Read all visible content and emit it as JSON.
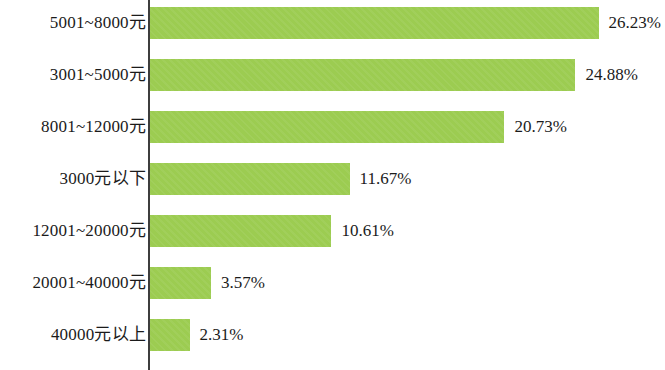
{
  "chart_data": {
    "type": "bar",
    "orientation": "horizontal",
    "title": "",
    "subtitle": "",
    "xlabel": "",
    "ylabel": "",
    "grid": false,
    "legend": null,
    "axis_line": true,
    "xlim": [
      0,
      26.23
    ],
    "value_suffix": "%",
    "bar_color": "#9ccc51",
    "text_color": "#1b1b1b",
    "background_color": "#ffffff",
    "categories": [
      "5001~8000元",
      "3001~5000元",
      "8001~12000元",
      "3000元以下",
      "12001~20000元",
      "20001~40000元",
      "40000元以上"
    ],
    "values": [
      26.23,
      24.88,
      20.73,
      11.67,
      10.61,
      3.57,
      2.31
    ],
    "value_labels": [
      "26.23%",
      "24.88%",
      "20.73%",
      "11.67%",
      "10.61%",
      "3.57%",
      "2.31%"
    ],
    "bars": [
      {
        "category": "5001~8000元",
        "value": 26.23,
        "label": "26.23%"
      },
      {
        "category": "3001~5000元",
        "value": 24.88,
        "label": "24.88%"
      },
      {
        "category": "8001~12000元",
        "value": 20.73,
        "label": "20.73%"
      },
      {
        "category": "3000元以下",
        "value": 11.67,
        "label": "11.67%"
      },
      {
        "category": "12001~20000元",
        "value": 10.61,
        "label": "10.61%"
      },
      {
        "category": "20001~40000元",
        "value": 3.57,
        "label": "3.57%"
      },
      {
        "category": "40000元以上",
        "value": 2.31,
        "label": "2.31%"
      }
    ]
  },
  "layout": {
    "axis_x": 148,
    "bar_start_x": 150,
    "bar_height": 32,
    "row_step": 52,
    "first_row_top": 7,
    "px_per_percent": 17.1,
    "value_label_gap": 10
  }
}
